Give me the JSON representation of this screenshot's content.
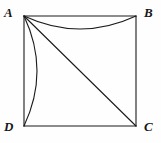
{
  "figure": {
    "type": "geometry-diagram",
    "background_color": "#fefefe",
    "stroke_color": "#1a1a1a",
    "stroke_width": 1,
    "labels": {
      "a": "A",
      "b": "B",
      "c": "C",
      "d": "D"
    },
    "vertices": {
      "A": {
        "x": 24,
        "y": 16
      },
      "B": {
        "x": 136,
        "y": 16
      },
      "C": {
        "x": 136,
        "y": 126
      },
      "D": {
        "x": 24,
        "y": 126
      }
    },
    "edges": [
      {
        "name": "side-AB",
        "from": "A",
        "to": "B"
      },
      {
        "name": "side-BC",
        "from": "B",
        "to": "C"
      },
      {
        "name": "side-CD",
        "from": "C",
        "to": "D"
      },
      {
        "name": "side-DA",
        "from": "D",
        "to": "A"
      },
      {
        "name": "diagonal-AC",
        "from": "A",
        "to": "C"
      }
    ],
    "arcs": [
      {
        "name": "arc-AB",
        "from": "A",
        "to": "B",
        "bulge_direction": "downward",
        "mid_x": 80,
        "mid_y": 29
      },
      {
        "name": "arc-AD",
        "from": "A",
        "to": "D",
        "bulge_direction": "rightward",
        "mid_x": 37,
        "mid_y": 71
      }
    ]
  }
}
